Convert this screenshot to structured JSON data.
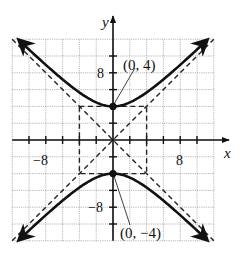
{
  "chart_data": {
    "type": "line",
    "title": "",
    "xlabel": "x",
    "ylabel": "y",
    "xlim": [
      -12,
      12
    ],
    "ylim": [
      -12,
      12
    ],
    "grid": true,
    "grid_step": 2,
    "x_tick_labels": [
      {
        "value": -8,
        "label": "−8"
      },
      {
        "value": 8,
        "label": "8"
      }
    ],
    "y_tick_labels": [
      {
        "value": 8,
        "label": "8"
      },
      {
        "value": -8,
        "label": "−8"
      }
    ],
    "series": [
      {
        "name": "hyperbola upper branch",
        "equation": "y^2/16 - x^2/16 = 1",
        "branch": "upper",
        "style": "solid"
      },
      {
        "name": "hyperbola lower branch",
        "equation": "y^2/16 - x^2/16 = 1",
        "branch": "lower",
        "style": "solid"
      },
      {
        "name": "asymptote y = x",
        "equation": "y = x",
        "style": "dashed"
      },
      {
        "name": "asymptote y = -x",
        "equation": "y = -x",
        "style": "dashed"
      },
      {
        "name": "central rectangle",
        "corners": [
          [
            -4,
            4
          ],
          [
            4,
            4
          ],
          [
            4,
            -4
          ],
          [
            -4,
            -4
          ]
        ],
        "style": "dashed"
      }
    ],
    "points": [
      {
        "x": 0,
        "y": 4,
        "label": "(0, 4)"
      },
      {
        "x": 0,
        "y": -4,
        "label": "(0, −4)"
      }
    ]
  },
  "labels": {
    "x_axis": "x",
    "y_axis": "y",
    "tick_x_neg8": "−8",
    "tick_x_pos8": "8",
    "tick_y_pos8": "8",
    "tick_y_neg8": "−8",
    "vertex_top": "(0, 4)",
    "vertex_bottom": "(0, −4)"
  }
}
